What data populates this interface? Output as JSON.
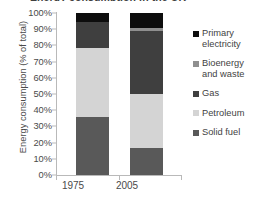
{
  "chart_data": {
    "type": "bar",
    "subtype": "stacked-100-percent",
    "title": "Energy consumption in the UK",
    "xlabel": "",
    "ylabel": "Energy consumption (% of total)",
    "categories": [
      "1975",
      "2005"
    ],
    "ylim": [
      0,
      100
    ],
    "ytick_labels": [
      "0%",
      "10%",
      "20%",
      "30%",
      "40%",
      "50%",
      "60%",
      "70%",
      "80%",
      "90%",
      "100%"
    ],
    "ytick_values": [
      0,
      10,
      20,
      30,
      40,
      50,
      60,
      70,
      80,
      90,
      100
    ],
    "grid": false,
    "legend_position": "right",
    "series": [
      {
        "name": "Primary electricity",
        "color": "#0d0d0d",
        "values": [
          5.5,
          9.0
        ]
      },
      {
        "name": "Bioenergy and waste",
        "color": "#8f8f8f",
        "values": [
          0.0,
          2.0
        ]
      },
      {
        "name": "Gas",
        "color": "#3f3f3f",
        "values": [
          16.0,
          39.0
        ]
      },
      {
        "name": "Petroleum",
        "color": "#d4d4d4",
        "values": [
          42.5,
          33.3
        ]
      },
      {
        "name": "Solid fuel",
        "color": "#595959",
        "values": [
          36.0,
          16.7
        ]
      }
    ],
    "stack_order_bottom_to_top": [
      "Solid fuel",
      "Petroleum",
      "Gas",
      "Bioenergy and waste",
      "Primary electricity"
    ]
  },
  "legend": {
    "items": [
      {
        "label": "Primary electricity",
        "color": "#0d0d0d"
      },
      {
        "label": "Bioenergy and waste",
        "color": "#8f8f8f"
      },
      {
        "label": "Gas",
        "color": "#3f3f3f"
      },
      {
        "label": "Petroleum",
        "color": "#d4d4d4"
      },
      {
        "label": "Solid fuel",
        "color": "#595959"
      }
    ]
  }
}
